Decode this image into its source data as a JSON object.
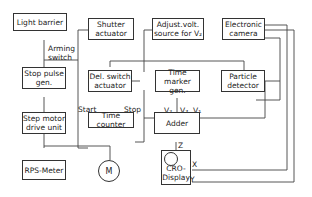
{
  "blocks": {
    "light_barrier": "Light barrier",
    "shutter_actuator": "Shutter\nactuator",
    "adjust_volt_source": "Adjust.volt.\nsource for V₂",
    "electronic_camera": "Electronic\ncamera",
    "stop_pulse_gen": "Stop pulse\ngen.",
    "del_switch_actuator": "Del. switch\nactuator",
    "time_marker_gen": "Time marker\ngen.",
    "particle_detector": "Particle\ndetector",
    "step_motor_drive_unit": "Step motor\ndrive unit",
    "time_counter": "Time counter",
    "adder": "Adder",
    "rps_meter": "RPS-Meter",
    "motor": "M",
    "cro_display": "CRO-\nDisplay"
  },
  "labels": {
    "arming_switch": "Arming\nswitch",
    "start": "Start",
    "stop": "Stop",
    "v1": "V₁",
    "v2": "V₂",
    "v3": "V₃",
    "z": "Z",
    "x": "X",
    "y": "Y"
  },
  "colors": {
    "line": "#444444",
    "background": "#ffffff"
  }
}
